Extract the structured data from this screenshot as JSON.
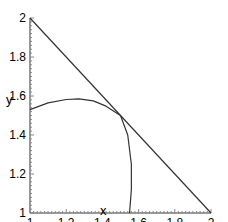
{
  "chart_data": {
    "type": "line",
    "title": "",
    "xlabel": "x",
    "ylabel": "y",
    "xlim": [
      1,
      2
    ],
    "ylim": [
      1,
      2
    ],
    "grid": false,
    "x_ticks": [
      "1",
      "1.2",
      "1.4",
      "1.6",
      "1.8",
      "2"
    ],
    "y_ticks": [
      "1",
      "1.2",
      "1.4",
      "1.6",
      "1.8",
      "2"
    ],
    "series": [
      {
        "name": "line",
        "x": [
          1,
          2
        ],
        "y": [
          2,
          1
        ]
      },
      {
        "name": "curve",
        "x": [
          1.0,
          1.1,
          1.2,
          1.27,
          1.35,
          1.42,
          1.5,
          1.54,
          1.56,
          1.56,
          1.55
        ],
        "y": [
          1.53,
          1.565,
          1.582,
          1.585,
          1.575,
          1.548,
          1.5,
          1.4,
          1.25,
          1.12,
          1.0
        ]
      }
    ]
  }
}
